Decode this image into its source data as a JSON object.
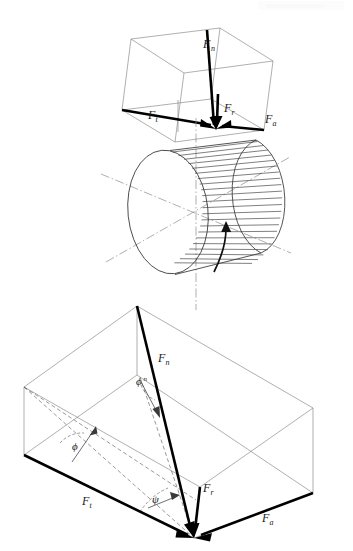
{
  "figure": {
    "caption": "",
    "background_color": "#ffffff",
    "line_color": "#2a2a2a",
    "vector_color": "#000000",
    "axis_color": "#8c8c8c",
    "watermark_text": ""
  },
  "panels": [
    {
      "id": "top-panel",
      "name": "upper-force-box",
      "description": "Isometric rectangular box showing resolved gear tooth force components at the pitch point above the gear blank"
    },
    {
      "id": "middle-panel",
      "name": "gear-blank-cylinder",
      "description": "Isometric helical gear blank cylinder with teeth lines, centerlines and rotation arrow"
    },
    {
      "id": "bottom-panel",
      "name": "lower-force-box",
      "description": "Enlarged isometric force parallelepiped with pressure angle, normal pressure angle and helix angle"
    }
  ],
  "labels": {
    "top": {
      "normal_force": "F",
      "normal_force_sub": "n",
      "tangential_force": "F",
      "tangential_force_sub": "t",
      "radial_force": "F",
      "radial_force_sub": "r",
      "axial_force": "F",
      "axial_force_sub": "a"
    },
    "bottom": {
      "normal_force": "F",
      "normal_force_sub": "n",
      "tangential_force": "F",
      "tangential_force_sub": "t",
      "radial_force": "F",
      "radial_force_sub": "r",
      "axial_force": "F",
      "axial_force_sub": "a",
      "pressure_angle": "ϕ",
      "normal_pressure_angle": "ϕ",
      "normal_pressure_angle_sup": "n",
      "helix_angle": "ψ"
    }
  },
  "geometry": {
    "top_box": {
      "front_bottom_left": [
        122,
        110
      ],
      "front_bottom_right": [
        272,
        122
      ],
      "apex_top": [
        205,
        30
      ],
      "force_point": [
        216,
        128
      ]
    },
    "cylinder": {
      "center": [
        196,
        210
      ],
      "face_center": [
        168,
        212
      ],
      "radius_x": 40,
      "radius_y": 62,
      "teeth_count": 19
    },
    "bottom_box": {
      "origin_force_point": [
        194,
        538
      ],
      "apex_top": [
        137,
        306
      ],
      "left_corner": [
        24,
        387
      ],
      "right_corner": [
        313,
        493
      ]
    }
  },
  "vectors": [
    {
      "name": "F_n",
      "label": "F",
      "sub": "n",
      "panel": "top"
    },
    {
      "name": "F_t",
      "label": "F",
      "sub": "t",
      "panel": "top"
    },
    {
      "name": "F_r",
      "label": "F",
      "sub": "r",
      "panel": "top"
    },
    {
      "name": "F_a",
      "label": "F",
      "sub": "a",
      "panel": "top"
    },
    {
      "name": "F_n",
      "label": "F",
      "sub": "n",
      "panel": "bottom"
    },
    {
      "name": "F_t",
      "label": "F",
      "sub": "t",
      "panel": "bottom"
    },
    {
      "name": "F_r",
      "label": "F",
      "sub": "r",
      "panel": "bottom"
    },
    {
      "name": "F_a",
      "label": "F",
      "sub": "a",
      "panel": "bottom"
    }
  ],
  "angles": [
    {
      "name": "phi",
      "symbol": "ϕ",
      "superscript": "",
      "panel": "bottom",
      "description": "transverse pressure angle"
    },
    {
      "name": "phi_n",
      "symbol": "ϕ",
      "superscript": "n",
      "panel": "bottom",
      "description": "normal pressure angle"
    },
    {
      "name": "psi",
      "symbol": "ψ",
      "superscript": "",
      "panel": "bottom",
      "description": "helix angle"
    }
  ]
}
